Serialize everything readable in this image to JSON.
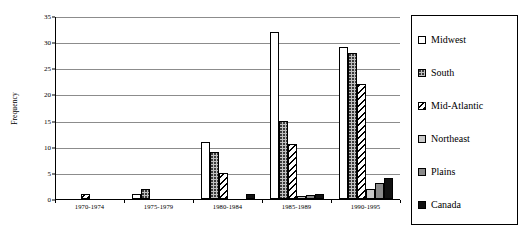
{
  "chart_data": {
    "type": "bar",
    "title": "",
    "subtitle": "",
    "xlabel": "",
    "ylabel": "Frequency",
    "ylim": [
      0,
      35
    ],
    "ytick_step": 5,
    "yticks": [
      0,
      5,
      10,
      15,
      20,
      25,
      30,
      35
    ],
    "grid": true,
    "grid_orientation": "horizontal",
    "legend_position": "right",
    "categories": [
      "1970-1974",
      "1975-1979",
      "1980-1984",
      "1985-1989",
      "1990-1995"
    ],
    "series": [
      {
        "name": "Midwest",
        "pattern": "solid-white",
        "color": "#ffffff",
        "values": [
          0,
          1,
          11,
          32,
          29
        ]
      },
      {
        "name": "South",
        "pattern": "dotted-gray",
        "color": "#c0c0c0",
        "values": [
          0,
          2,
          9,
          15,
          28
        ]
      },
      {
        "name": "Mid-Atlantic",
        "pattern": "diagonal-hatch",
        "color": "#ffffff",
        "values": [
          1,
          0,
          5,
          10.5,
          22
        ]
      },
      {
        "name": "Northeast",
        "pattern": "solid-lightgray",
        "color": "#c9c9c9",
        "values": [
          0,
          0,
          0,
          0.5,
          2
        ]
      },
      {
        "name": "Plains",
        "pattern": "solid-midgray",
        "color": "#8a8a8a",
        "values": [
          0,
          0,
          0,
          0.7,
          3
        ]
      },
      {
        "name": "Canada",
        "pattern": "solid-black",
        "color": "#111111",
        "values": [
          0,
          0,
          1,
          1,
          4
        ]
      }
    ]
  },
  "axes": {
    "y_title": "Frequency"
  },
  "legend": {
    "items": [
      {
        "label": "Midwest"
      },
      {
        "label": "South"
      },
      {
        "label": "Mid-Atlantic"
      },
      {
        "label": "Northeast"
      },
      {
        "label": "Plains"
      },
      {
        "label": "Canada"
      }
    ]
  }
}
